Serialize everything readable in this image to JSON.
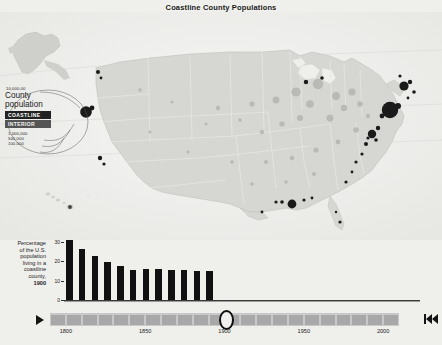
{
  "title": "Coastline County Populations",
  "legend": {
    "top_value": "10,000,00",
    "title_line1": "County",
    "title_line2": "population",
    "coastline_label": "COASTLINE",
    "interior_label": "INTERIOR",
    "values": [
      "1,000,000",
      "500,000",
      "100,000"
    ],
    "coastline_color": "#222222",
    "interior_color": "#555555"
  },
  "map": {
    "land_color": "#d6d6d3",
    "water_color": "#efefec",
    "border_color": "#c2c2bf",
    "insets": [
      "alaska-inset",
      "hawaii-inset"
    ]
  },
  "chart_data": {
    "type": "bar",
    "title": "Percentage of the U.S. population living in a coastline county, 1900",
    "caption_lines": [
      "Percentage",
      "of the U.S.",
      "population",
      "living in a",
      "coastline",
      "county,"
    ],
    "caption_year": "1900",
    "xlabel": "",
    "ylabel": "",
    "ylim": [
      0,
      32
    ],
    "yticks": [
      0,
      10,
      20,
      30
    ],
    "ytick_labels": [
      "0",
      "10",
      "20",
      "30"
    ],
    "grid": false,
    "categories": [
      "1790",
      "1800",
      "1810",
      "1820",
      "1830",
      "1840",
      "1850",
      "1860",
      "1870",
      "1880",
      "1890",
      "1900"
    ],
    "values": [
      31.2,
      26.4,
      22.9,
      19.6,
      17.6,
      15.7,
      15.8,
      15.8,
      15.4,
      15.4,
      15.2,
      15.1
    ],
    "bar_color": "#111111"
  },
  "timeline": {
    "play_label": "play",
    "current_year": "1900",
    "min": 1790,
    "max": 2010,
    "segments": 22,
    "tick_labels": [
      "1800",
      "1850",
      "1900",
      "1950",
      "2000"
    ],
    "tick_years": [
      1800,
      1850,
      1900,
      1950,
      2000
    ],
    "end_control_label": "skip-to-start"
  }
}
